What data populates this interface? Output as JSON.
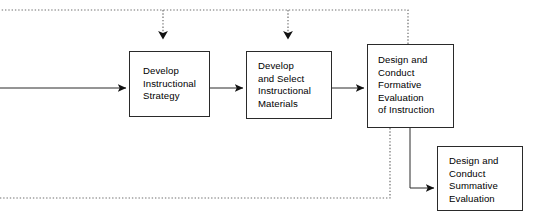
{
  "diagram": {
    "background_color": "#ffffff",
    "stroke_color": "#2a2a2a",
    "dotted_color": "#6e6e6e",
    "nodes": [
      {
        "id": "strategy",
        "label": "Develop\nInstructional\nStrategy",
        "x": 129,
        "y": 51,
        "width": 81,
        "height": 66
      },
      {
        "id": "materials",
        "label": "Develop\nand Select\nInstructional\nMaterials",
        "x": 246,
        "y": 51,
        "width": 86,
        "height": 68
      },
      {
        "id": "formative",
        "label": "Design and\nConduct\nFormative\nEvaluation\nof Instruction",
        "x": 367,
        "y": 44,
        "width": 87,
        "height": 84
      },
      {
        "id": "summative",
        "label": "Design and\nConduct\nSummative\nEvaluation",
        "x": 437,
        "y": 146,
        "width": 86,
        "height": 65
      }
    ],
    "connectors": [
      {
        "id": "inflow-to-strategy",
        "style": "solid",
        "from": "left-edge",
        "to": "strategy",
        "arrowhead": true
      },
      {
        "id": "strategy-to-materials",
        "style": "solid",
        "from": "strategy",
        "to": "materials",
        "arrowhead": true
      },
      {
        "id": "materials-to-formative",
        "style": "solid",
        "from": "materials",
        "to": "formative",
        "arrowhead": true
      },
      {
        "id": "formative-to-summative",
        "style": "solid",
        "from": "formative",
        "to": "summative",
        "arrowhead": true
      },
      {
        "id": "revision-bus-top",
        "style": "dotted",
        "from": "formative",
        "to": "top-feedback-bus",
        "arrowhead": false
      },
      {
        "id": "revision-to-strategy",
        "style": "dotted",
        "from": "top-feedback-bus",
        "to": "strategy",
        "arrowhead": true
      },
      {
        "id": "revision-to-materials",
        "style": "dotted",
        "from": "top-feedback-bus",
        "to": "materials",
        "arrowhead": true
      },
      {
        "id": "revision-bus-bottom",
        "style": "dotted",
        "from": "formative",
        "to": "left-edge-bottom",
        "arrowhead": false
      }
    ]
  }
}
